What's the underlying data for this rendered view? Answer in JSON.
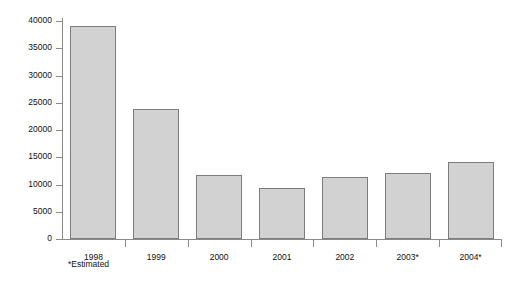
{
  "chart_data": {
    "type": "bar",
    "title": "",
    "subtitle": "",
    "xlabel": "",
    "ylabel": "US $ million",
    "categories": [
      "1998",
      "1999",
      "2000",
      "2001",
      "2002",
      "2003*",
      "2004*"
    ],
    "values": [
      39000,
      23900,
      11700,
      9300,
      11400,
      12200,
      14100
    ],
    "series": [
      {
        "name": "US $ million",
        "values": [
          39000,
          23900,
          11700,
          9300,
          11400,
          12200,
          14100
        ]
      }
    ],
    "ylim": [
      0,
      40000
    ],
    "ytick_labels": [
      "0",
      "5000",
      "10000",
      "15000",
      "20000",
      "25000",
      "30000",
      "35000",
      "40000"
    ],
    "ytick_values": [
      0,
      5000,
      10000,
      15000,
      20000,
      25000,
      30000,
      35000,
      40000
    ],
    "grid": false,
    "legend": false,
    "legend_position": "none",
    "annotations": [
      "*Estimated"
    ],
    "bar_fill_color": "#d2d2d2",
    "bar_border_color": "#7d7d7d",
    "axis_color": "#8a8a8a",
    "text_color": "#111111",
    "background_color": "#ffffff"
  },
  "footnote": "*Estimated"
}
